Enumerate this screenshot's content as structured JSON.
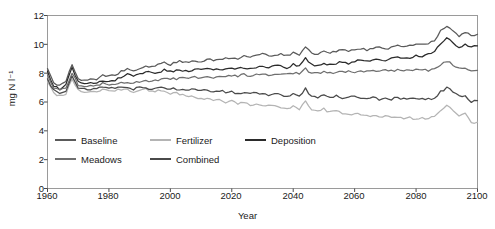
{
  "chart_data": {
    "type": "line",
    "title": "",
    "xlabel": "Year",
    "ylabel": "mg N l⁻¹",
    "xlim": [
      1960,
      2100
    ],
    "ylim": [
      0,
      12
    ],
    "xticks": [
      1960,
      1980,
      2000,
      2020,
      2040,
      2060,
      2080,
      2100
    ],
    "yticks": [
      0,
      2,
      4,
      6,
      8,
      10,
      12
    ],
    "grid": false,
    "legend_position": "inside-lower-left",
    "series": [
      {
        "name": "Baseline",
        "color": "#5a5a5a",
        "x": [
          1960,
          1962,
          1964,
          1966,
          1968,
          1970,
          1972,
          1974,
          1976,
          1978,
          1980,
          1982,
          1984,
          1986,
          1988,
          1990,
          1992,
          1994,
          1996,
          1998,
          2000,
          2002,
          2004,
          2006,
          2008,
          2010,
          2012,
          2014,
          2016,
          2018,
          2020,
          2022,
          2024,
          2026,
          2028,
          2030,
          2032,
          2034,
          2036,
          2038,
          2040,
          2042,
          2044,
          2046,
          2048,
          2050,
          2052,
          2054,
          2056,
          2058,
          2060,
          2062,
          2064,
          2066,
          2068,
          2070,
          2072,
          2074,
          2076,
          2078,
          2080,
          2082,
          2084,
          2086,
          2088,
          2090,
          2092,
          2094,
          2096,
          2098,
          2100
        ],
        "values": [
          8.3,
          7.3,
          7.1,
          7.4,
          8.6,
          7.6,
          7.5,
          7.6,
          7.6,
          7.9,
          7.8,
          7.9,
          8.1,
          8.3,
          8.2,
          8.3,
          8.5,
          8.4,
          8.6,
          8.7,
          8.6,
          8.8,
          8.8,
          8.7,
          8.9,
          8.8,
          9.0,
          8.9,
          9.0,
          9.0,
          9.1,
          9.0,
          9.2,
          9.1,
          9.2,
          9.3,
          9.2,
          9.3,
          9.3,
          9.2,
          9.4,
          9.3,
          9.8,
          9.4,
          9.3,
          9.5,
          9.4,
          9.5,
          9.6,
          9.5,
          9.6,
          9.7,
          9.6,
          9.7,
          9.8,
          9.7,
          9.8,
          9.9,
          9.8,
          9.9,
          10.0,
          10.0,
          10.1,
          10.3,
          10.9,
          11.2,
          10.9,
          10.6,
          10.8,
          10.6,
          10.7
        ]
      },
      {
        "name": "Fertilizer",
        "color": "#b4b4b4",
        "x": [
          1960,
          1962,
          1964,
          1966,
          1968,
          1970,
          1972,
          1974,
          1976,
          1978,
          1980,
          1982,
          1984,
          1986,
          1988,
          1990,
          1992,
          1994,
          1996,
          1998,
          2000,
          2002,
          2004,
          2006,
          2008,
          2010,
          2012,
          2014,
          2016,
          2018,
          2020,
          2022,
          2024,
          2026,
          2028,
          2030,
          2032,
          2034,
          2036,
          2038,
          2040,
          2042,
          2044,
          2046,
          2048,
          2050,
          2052,
          2054,
          2056,
          2058,
          2060,
          2062,
          2064,
          2066,
          2068,
          2070,
          2072,
          2074,
          2076,
          2078,
          2080,
          2082,
          2084,
          2086,
          2088,
          2090,
          2092,
          2094,
          2096,
          2098,
          2100
        ],
        "values": [
          7.4,
          6.6,
          6.4,
          6.6,
          7.6,
          6.8,
          6.7,
          6.7,
          6.7,
          6.9,
          6.8,
          6.8,
          6.9,
          6.9,
          6.7,
          6.8,
          6.9,
          6.7,
          6.8,
          6.7,
          6.6,
          6.6,
          6.5,
          6.3,
          6.4,
          6.2,
          6.3,
          6.1,
          6.2,
          6.0,
          6.1,
          5.9,
          6.0,
          5.8,
          5.9,
          5.8,
          5.7,
          5.8,
          5.6,
          5.5,
          5.7,
          5.5,
          6.0,
          5.4,
          5.3,
          5.5,
          5.3,
          5.4,
          5.2,
          5.1,
          5.2,
          5.1,
          5.0,
          5.1,
          4.9,
          5.0,
          4.9,
          5.0,
          4.8,
          4.9,
          4.8,
          4.9,
          4.8,
          5.0,
          5.4,
          5.8,
          5.4,
          5.0,
          5.2,
          4.5,
          4.6
        ]
      },
      {
        "name": "Deposition",
        "color": "#2b2b2b",
        "x": [
          1960,
          1962,
          1964,
          1966,
          1968,
          1970,
          1972,
          1974,
          1976,
          1978,
          1980,
          1982,
          1984,
          1986,
          1988,
          1990,
          1992,
          1994,
          1996,
          1998,
          2000,
          2002,
          2004,
          2006,
          2008,
          2010,
          2012,
          2014,
          2016,
          2018,
          2020,
          2022,
          2024,
          2026,
          2028,
          2030,
          2032,
          2034,
          2036,
          2038,
          2040,
          2042,
          2044,
          2046,
          2048,
          2050,
          2052,
          2054,
          2056,
          2058,
          2060,
          2062,
          2064,
          2066,
          2068,
          2070,
          2072,
          2074,
          2076,
          2078,
          2080,
          2082,
          2084,
          2086,
          2088,
          2090,
          2092,
          2094,
          2096,
          2098,
          2100
        ],
        "values": [
          8.1,
          7.1,
          6.9,
          7.2,
          8.4,
          7.4,
          7.3,
          7.3,
          7.3,
          7.5,
          7.4,
          7.5,
          7.7,
          7.9,
          7.8,
          7.9,
          8.1,
          8.0,
          8.1,
          8.2,
          8.1,
          8.2,
          8.2,
          8.1,
          8.3,
          8.2,
          8.3,
          8.2,
          8.3,
          8.3,
          8.4,
          8.3,
          8.4,
          8.3,
          8.4,
          8.5,
          8.4,
          8.5,
          8.5,
          8.4,
          8.6,
          8.5,
          9.0,
          8.6,
          8.5,
          8.7,
          8.6,
          8.7,
          8.8,
          8.7,
          8.8,
          8.9,
          8.8,
          8.9,
          9.0,
          8.9,
          9.0,
          9.1,
          9.0,
          9.1,
          9.2,
          9.2,
          9.3,
          9.5,
          10.1,
          10.4,
          10.1,
          9.8,
          10.0,
          9.8,
          9.9
        ]
      },
      {
        "name": "Meadows",
        "color": "#6e6e6e",
        "x": [
          1960,
          1962,
          1964,
          1966,
          1968,
          1970,
          1972,
          1974,
          1976,
          1978,
          1980,
          1982,
          1984,
          1986,
          1988,
          1990,
          1992,
          1994,
          1996,
          1998,
          2000,
          2002,
          2004,
          2006,
          2008,
          2010,
          2012,
          2014,
          2016,
          2018,
          2020,
          2022,
          2024,
          2026,
          2028,
          2030,
          2032,
          2034,
          2036,
          2038,
          2040,
          2042,
          2044,
          2046,
          2048,
          2050,
          2052,
          2054,
          2056,
          2058,
          2060,
          2062,
          2064,
          2066,
          2068,
          2070,
          2072,
          2074,
          2076,
          2078,
          2080,
          2082,
          2084,
          2086,
          2088,
          2090,
          2092,
          2094,
          2096,
          2098,
          2100
        ],
        "values": [
          7.8,
          7.0,
          6.8,
          7.0,
          8.0,
          7.2,
          7.1,
          7.1,
          7.1,
          7.3,
          7.2,
          7.2,
          7.3,
          7.4,
          7.3,
          7.4,
          7.5,
          7.4,
          7.5,
          7.6,
          7.6,
          7.6,
          7.7,
          7.6,
          7.7,
          7.7,
          7.7,
          7.7,
          7.8,
          7.8,
          7.8,
          7.8,
          7.9,
          7.8,
          7.9,
          7.9,
          7.9,
          7.9,
          8.0,
          7.9,
          8.0,
          8.0,
          8.3,
          8.0,
          8.0,
          8.1,
          8.0,
          8.1,
          8.1,
          8.1,
          8.1,
          8.1,
          8.1,
          8.2,
          8.1,
          8.2,
          8.2,
          8.2,
          8.2,
          8.2,
          8.2,
          8.2,
          8.2,
          8.3,
          8.6,
          8.8,
          8.6,
          8.3,
          8.3,
          8.2,
          8.2
        ]
      },
      {
        "name": "Combined",
        "color": "#4a4a4a",
        "x": [
          1960,
          1962,
          1964,
          1966,
          1968,
          1970,
          1972,
          1974,
          1976,
          1978,
          1980,
          1982,
          1984,
          1986,
          1988,
          1990,
          1992,
          1994,
          1996,
          1998,
          2000,
          2002,
          2004,
          2006,
          2008,
          2010,
          2012,
          2014,
          2016,
          2018,
          2020,
          2022,
          2024,
          2026,
          2028,
          2030,
          2032,
          2034,
          2036,
          2038,
          2040,
          2042,
          2044,
          2046,
          2048,
          2050,
          2052,
          2054,
          2056,
          2058,
          2060,
          2062,
          2064,
          2066,
          2068,
          2070,
          2072,
          2074,
          2076,
          2078,
          2080,
          2082,
          2084,
          2086,
          2088,
          2090,
          2092,
          2094,
          2096,
          2098,
          2100
        ],
        "values": [
          7.6,
          6.8,
          6.6,
          6.8,
          7.8,
          7.0,
          6.9,
          6.9,
          6.9,
          7.1,
          7.0,
          7.0,
          7.0,
          7.0,
          6.9,
          7.0,
          7.0,
          6.9,
          7.0,
          7.0,
          6.9,
          6.9,
          6.9,
          6.8,
          6.9,
          6.8,
          6.8,
          6.7,
          6.8,
          6.7,
          6.7,
          6.6,
          6.7,
          6.6,
          6.6,
          6.6,
          6.5,
          6.6,
          6.5,
          6.4,
          6.6,
          6.4,
          6.9,
          6.4,
          6.3,
          6.5,
          6.4,
          6.4,
          6.3,
          6.3,
          6.4,
          6.3,
          6.3,
          6.3,
          6.2,
          6.3,
          6.2,
          6.3,
          6.2,
          6.2,
          6.2,
          6.2,
          6.2,
          6.3,
          6.7,
          7.0,
          6.7,
          6.4,
          6.5,
          6.0,
          6.1
        ]
      }
    ],
    "legend": [
      {
        "label": "Baseline",
        "color": "#5a5a5a"
      },
      {
        "label": "Fertilizer",
        "color": "#b4b4b4"
      },
      {
        "label": "Deposition",
        "color": "#2b2b2b"
      },
      {
        "label": "Meadows",
        "color": "#6e6e6e"
      },
      {
        "label": "Combined",
        "color": "#4a4a4a"
      }
    ]
  },
  "axes": {
    "x_tick_labels": [
      "1960",
      "1980",
      "2000",
      "2020",
      "2040",
      "2060",
      "2080",
      "2100"
    ],
    "y_tick_labels": [
      "0",
      "2",
      "4",
      "6",
      "8",
      "10",
      "12"
    ],
    "x_title": "Year",
    "y_title": "mg N l⁻¹"
  },
  "style": {
    "frame_color": "#9a9a9a",
    "text_color": "#1a1a1a",
    "background": "#ffffff"
  }
}
